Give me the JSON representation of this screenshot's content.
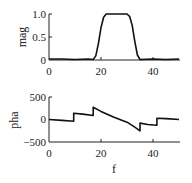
{
  "chart_data": [
    {
      "type": "line",
      "title": "",
      "xlabel": "",
      "ylabel": "mag",
      "xlim": [
        0,
        50
      ],
      "ylim": [
        0,
        1.0
      ],
      "xticks": [
        "0",
        "20",
        "40"
      ],
      "yticks": [
        "0",
        "0.5",
        "1.0"
      ],
      "grid": false,
      "x": [
        0,
        5,
        10,
        15,
        17,
        18,
        19,
        20,
        21,
        22,
        23,
        25,
        28,
        30,
        31,
        32,
        33,
        34,
        35,
        40,
        45,
        50
      ],
      "values": [
        0.01,
        0.01,
        0.0,
        0.01,
        0.0,
        0.08,
        0.35,
        0.7,
        0.93,
        1.0,
        1.0,
        1.0,
        1.0,
        1.0,
        0.95,
        0.75,
        0.4,
        0.1,
        0.0,
        0.01,
        0.0,
        0.01
      ]
    },
    {
      "type": "line",
      "title": "",
      "xlabel": "f",
      "ylabel": "pha",
      "xlim": [
        0,
        50
      ],
      "ylim": [
        -500,
        500
      ],
      "xticks": [
        "0",
        "20",
        "40"
      ],
      "yticks": [
        "-500",
        "0",
        "500"
      ],
      "grid": false,
      "x": [
        0,
        5,
        9.5,
        9.5,
        13,
        17,
        17,
        20,
        25,
        30,
        33,
        35,
        35,
        38,
        41.5,
        41.5,
        45,
        50
      ],
      "values": [
        0,
        -20,
        -40,
        140,
        120,
        90,
        270,
        180,
        50,
        -60,
        -170,
        -250,
        -80,
        -110,
        -130,
        30,
        20,
        0
      ]
    }
  ],
  "labels": {
    "mag_ylabel": "mag",
    "pha_ylabel": "pha",
    "xlabel": "f",
    "mag_yticks": [
      "1.0",
      "0.5",
      "0"
    ],
    "pha_yticks": [
      "500",
      "0",
      "−500"
    ],
    "xticks": [
      "0",
      "20",
      "40"
    ]
  }
}
